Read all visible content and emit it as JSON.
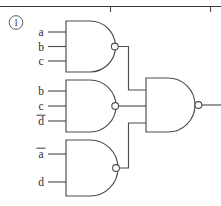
{
  "page": {
    "background_color": "#ffffff",
    "line_color": "#4d4d4d",
    "text_color": "#2e2e2e"
  },
  "header_rule": {
    "name": "horizontal-rule",
    "tick_count": 2
  },
  "problem_marker": {
    "label": "1",
    "style": "circled-numeral",
    "display": "①"
  },
  "circuit": {
    "type": "combinational-logic",
    "gate_type": "NAND",
    "gates": [
      {
        "id": "gate1",
        "label": "NAND gate 1",
        "inputs": [
          {
            "name": "a",
            "overbar": false
          },
          {
            "name": "b",
            "overbar": false
          },
          {
            "name": "c",
            "overbar": false
          }
        ],
        "output_to": "output-gate-input-1"
      },
      {
        "id": "gate2",
        "label": "NAND gate 2",
        "inputs": [
          {
            "name": "b",
            "overbar": false
          },
          {
            "name": "c",
            "overbar": false
          },
          {
            "name": "d",
            "overbar": true
          }
        ],
        "output_to": "output-gate-input-2"
      },
      {
        "id": "gate3",
        "label": "NAND gate 3",
        "inputs": [
          {
            "name": "a",
            "overbar": true
          },
          {
            "name": "d",
            "overbar": false
          }
        ],
        "output_to": "output-gate-input-3"
      },
      {
        "id": "gate4",
        "label": "Output NAND gate",
        "inputs": [
          {
            "name": "gate1-out",
            "overbar": false
          },
          {
            "name": "gate2-out",
            "overbar": false
          },
          {
            "name": "gate3-out",
            "overbar": false
          }
        ],
        "output_to": "circuit-output"
      }
    ],
    "labels": {
      "a": "a",
      "b": "b",
      "c": "c",
      "d": "d"
    }
  }
}
